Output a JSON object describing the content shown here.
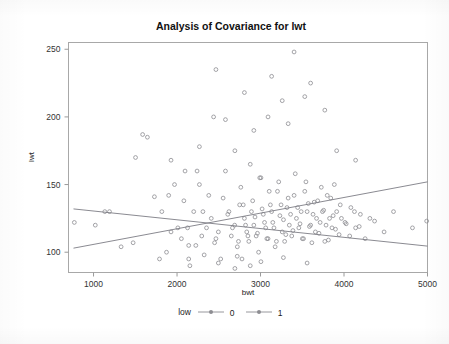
{
  "chart_data": {
    "type": "scatter",
    "title": "Analysis of Covariance for lwt",
    "xlabel": "bwt",
    "ylabel": "lwt",
    "xlim": [
      700,
      5000
    ],
    "ylim": [
      85,
      255
    ],
    "xticks": [
      1000,
      2000,
      3000,
      4000,
      5000
    ],
    "yticks": [
      100,
      150,
      200,
      250
    ],
    "grid": false,
    "legend_title": "low",
    "legend_position": "bottom",
    "legend_entries": [
      {
        "label": "0",
        "marker": "circle-line"
      },
      {
        "label": "1",
        "marker": "circle-line"
      }
    ],
    "series": [
      {
        "name": "0",
        "fit_line": {
          "x": [
            760,
            5000
          ],
          "y": [
            103.0,
            152.0
          ]
        },
        "points": [
          [
            1021,
            120
          ],
          [
            1135,
            130
          ],
          [
            1330,
            104
          ],
          [
            1474,
            107
          ],
          [
            1588,
            187
          ],
          [
            1729,
            141
          ],
          [
            1790,
            95
          ],
          [
            1818,
            130
          ],
          [
            1928,
            115
          ],
          [
            1970,
            150
          ],
          [
            2052,
            110
          ],
          [
            2082,
            138
          ],
          [
            2126,
            118
          ],
          [
            2154,
            90
          ],
          [
            2200,
            130
          ],
          [
            2225,
            105
          ],
          [
            2240,
            160
          ],
          [
            2296,
            112
          ],
          [
            2325,
            98
          ],
          [
            2380,
            142
          ],
          [
            2410,
            125
          ],
          [
            2450,
            107
          ],
          [
            2495,
            115
          ],
          [
            2523,
            95
          ],
          [
            2580,
            160
          ],
          [
            2622,
            130
          ],
          [
            2650,
            112
          ],
          [
            2690,
            120
          ],
          [
            2722,
            104
          ],
          [
            2750,
            135
          ],
          [
            2778,
            95
          ],
          [
            2807,
            125
          ],
          [
            2835,
            115
          ],
          [
            2860,
            108
          ],
          [
            2891,
            130
          ],
          [
            2920,
            120
          ],
          [
            2948,
            112
          ],
          [
            2977,
            100
          ],
          [
            3005,
            155
          ],
          [
            3033,
            128
          ],
          [
            3062,
            118
          ],
          [
            3090,
            110
          ],
          [
            3118,
            135
          ],
          [
            3147,
            122
          ],
          [
            3175,
            104
          ],
          [
            3203,
            145
          ],
          [
            3232,
            127
          ],
          [
            3260,
            115
          ],
          [
            3289,
            108
          ],
          [
            3317,
            133
          ],
          [
            3345,
            120
          ],
          [
            3374,
            112
          ],
          [
            3402,
            142
          ],
          [
            3430,
            125
          ],
          [
            3459,
            118
          ],
          [
            3487,
            130
          ],
          [
            3515,
            110
          ],
          [
            3544,
            152
          ],
          [
            3572,
            136
          ],
          [
            3600,
            120
          ],
          [
            3629,
            128
          ],
          [
            3657,
            115
          ],
          [
            3685,
            138
          ],
          [
            3714,
            122
          ],
          [
            3742,
            130
          ],
          [
            3770,
            108
          ],
          [
            3799,
            142
          ],
          [
            3827,
            125
          ],
          [
            3856,
            118
          ],
          [
            3884,
            150
          ],
          [
            3912,
            130
          ],
          [
            3941,
            113
          ],
          [
            3969,
            125
          ],
          [
            4026,
            121
          ],
          [
            4082,
            133
          ],
          [
            4139,
            118
          ],
          [
            4196,
            128
          ],
          [
            4253,
            110
          ],
          [
            4366,
            123
          ],
          [
            4593,
            130
          ],
          [
            4990,
            123
          ],
          [
            3090,
            200
          ],
          [
            3260,
            212
          ],
          [
            3402,
            248
          ],
          [
            3600,
            225
          ],
          [
            3770,
            205
          ],
          [
            2920,
            190
          ],
          [
            2580,
            198
          ],
          [
            3912,
            175
          ],
          [
            4139,
            168
          ]
        ]
      },
      {
        "name": "1",
        "fit_line": {
          "x": [
            760,
            5000
          ],
          "y": [
            132.0,
            104.5
          ]
        },
        "points": [
          [
            770,
            122
          ],
          [
            1191,
            130
          ],
          [
            1503,
            170
          ],
          [
            1645,
            185
          ],
          [
            1874,
            100
          ],
          [
            1900,
            142
          ],
          [
            2010,
            118
          ],
          [
            2096,
            160
          ],
          [
            2140,
            105
          ],
          [
            2268,
            150
          ],
          [
            2310,
            130
          ],
          [
            2353,
            118
          ],
          [
            2438,
            200
          ],
          [
            2466,
            110
          ],
          [
            2552,
            140
          ],
          [
            2608,
            128
          ],
          [
            2664,
            118
          ],
          [
            2693,
            175
          ],
          [
            2736,
            108
          ],
          [
            2764,
            148
          ],
          [
            2793,
            135
          ],
          [
            2821,
            120
          ],
          [
            2849,
            112
          ],
          [
            2877,
            165
          ],
          [
            2906,
            138
          ],
          [
            2934,
            126
          ],
          [
            2963,
            114
          ],
          [
            2991,
            155
          ],
          [
            3019,
            132
          ],
          [
            3048,
            122
          ],
          [
            3076,
            110
          ],
          [
            3104,
            145
          ],
          [
            3133,
            130
          ],
          [
            3161,
            118
          ],
          [
            3190,
            108
          ],
          [
            3218,
            152
          ],
          [
            3246,
            135
          ],
          [
            3275,
            124
          ],
          [
            3303,
            113
          ],
          [
            3331,
            140
          ],
          [
            3360,
            128
          ],
          [
            3388,
            116
          ],
          [
            3416,
            158
          ],
          [
            3445,
            133
          ],
          [
            3473,
            121
          ],
          [
            3501,
            110
          ],
          [
            3530,
            145
          ],
          [
            3558,
            130
          ],
          [
            3586,
            119
          ],
          [
            3615,
            107
          ],
          [
            3643,
            137
          ],
          [
            3671,
            125
          ],
          [
            3700,
            114
          ],
          [
            3728,
            148
          ],
          [
            3756,
            131
          ],
          [
            3785,
            120
          ],
          [
            3813,
            109
          ],
          [
            3841,
            140
          ],
          [
            3870,
            127
          ],
          [
            3898,
            117
          ],
          [
            3955,
            135
          ],
          [
            4012,
            122
          ],
          [
            4068,
            112
          ],
          [
            4125,
            130
          ],
          [
            4182,
            119
          ],
          [
            4310,
            125
          ],
          [
            4480,
            115
          ],
          [
            4820,
            118
          ],
          [
            2466,
            235
          ],
          [
            2807,
            218
          ],
          [
            3133,
            230
          ],
          [
            3331,
            195
          ],
          [
            3530,
            215
          ],
          [
            2268,
            178
          ],
          [
            1928,
            168
          ],
          [
            2140,
            95
          ],
          [
            2495,
            92
          ],
          [
            2721,
            97
          ],
          [
            3005,
            93
          ],
          [
            3274,
            96
          ],
          [
            3558,
            92
          ],
          [
            2693,
            88
          ],
          [
            2877,
            90
          ]
        ]
      }
    ]
  }
}
